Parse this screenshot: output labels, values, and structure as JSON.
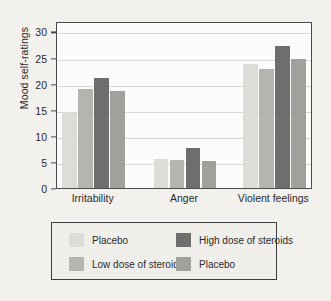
{
  "chart_data": {
    "type": "bar",
    "title": "",
    "xlabel": "",
    "ylabel": "Mood self-ratings",
    "ylim": [
      0,
      32
    ],
    "yticks": [
      0,
      5,
      10,
      15,
      20,
      25,
      30
    ],
    "ytick_labels": [
      "0",
      "5",
      "10",
      "15",
      "20",
      "25",
      "30"
    ],
    "grid": true,
    "legend_position": "below-axes",
    "categories": [
      "Irritability",
      "Anger",
      "Violent feelings"
    ],
    "series": [
      {
        "name": "Placebo",
        "color": "#dcdcd8",
        "values": [
          14.5,
          5.5,
          23.8
        ]
      },
      {
        "name": "Low dose of steroids",
        "color": "#b4b4b0",
        "values": [
          19.0,
          5.4,
          22.9
        ]
      },
      {
        "name": "High dose of steroids",
        "color": "#6e6e6c",
        "values": [
          21.0,
          7.7,
          27.2
        ]
      },
      {
        "name": "Placebo",
        "color": "#a0a09c",
        "values": [
          18.6,
          5.2,
          24.7
        ]
      }
    ],
    "legend_entries": [
      {
        "label": "Placebo",
        "color": "#dcdcd8"
      },
      {
        "label": "High dose of steroids",
        "color": "#6e6e6c"
      },
      {
        "label": "Low dose of steroids",
        "color": "#b4b4b0"
      },
      {
        "label": "Placebo",
        "color": "#a0a09c"
      }
    ]
  }
}
